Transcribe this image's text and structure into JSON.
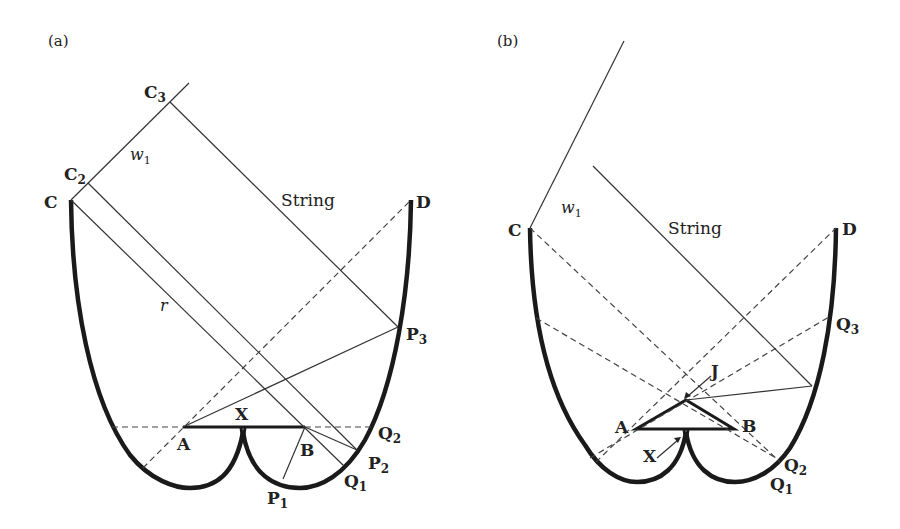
{
  "panels": {
    "a": {
      "panel_label": "(a)",
      "labels": {
        "C": "C",
        "C2_main": "C",
        "C2_sub": "2",
        "C3_main": "C",
        "C3_sub": "3",
        "D": "D",
        "w1_main": "w",
        "w1_sub": "1",
        "string": "String",
        "r": "r",
        "X": "X",
        "A": "A",
        "B": "B",
        "Q2_main": "Q",
        "Q2_sub": "2",
        "P2_main": "P",
        "P2_sub": "2",
        "Q1_main": "Q",
        "Q1_sub": "1",
        "P1_main": "P",
        "P1_sub": "1",
        "P3_main": "P",
        "P3_sub": "3"
      }
    },
    "b": {
      "panel_label": "(b)",
      "labels": {
        "C": "C",
        "D": "D",
        "w1_main": "w",
        "w1_sub": "1",
        "string": "String",
        "J": "J",
        "A": "A",
        "B": "B",
        "X": "X",
        "Q3_main": "Q",
        "Q3_sub": "3",
        "Q2_main": "Q",
        "Q2_sub": "2",
        "Q1_main": "Q",
        "Q1_sub": "1"
      }
    }
  },
  "colors": {
    "ink": "#1a1a1a",
    "background": "#ffffff"
  }
}
